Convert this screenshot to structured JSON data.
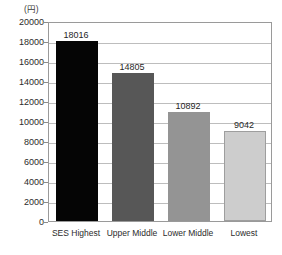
{
  "chart_data": {
    "type": "bar",
    "title": "",
    "subtitle": "",
    "xlabel": "",
    "ylabel": "(円)",
    "unit_label": "(円)",
    "categories": [
      "SES Highest",
      "Upper Middle",
      "Lower Middle",
      "Lowest"
    ],
    "values": [
      18016,
      14805,
      10892,
      9042
    ],
    "value_labels": [
      "18016",
      "14805",
      "10892",
      "9042"
    ],
    "ylim": [
      0,
      20000
    ],
    "ytick_step": 2000,
    "ytick_labels": [
      "20000",
      "18000",
      "16000",
      "14000",
      "12000",
      "10000",
      "8000",
      "6000",
      "4000",
      "2000",
      "0"
    ],
    "ytick_values": [
      20000,
      18000,
      16000,
      14000,
      12000,
      10000,
      8000,
      6000,
      4000,
      2000,
      0
    ],
    "grid": true,
    "grid_orientation": "horizontal",
    "legend": false,
    "legend_position": "none",
    "bar_colors": [
      "#050505",
      "#575757",
      "#949494",
      "#cdcdcd"
    ],
    "bar_border_colors": [
      "#050505",
      "#575757",
      "#949494",
      "#9e9e9e"
    ],
    "frame_color": "#9a9a9a",
    "grid_color": "#bdbdbd",
    "background": "#ffffff",
    "text_color": "#2b2b2b"
  }
}
